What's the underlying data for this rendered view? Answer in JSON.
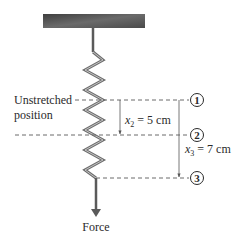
{
  "diagram": {
    "labels": {
      "unstretched_line1": "Unstretched",
      "unstretched_line2": "position",
      "force": "Force"
    },
    "positions": [
      {
        "id": "1",
        "marker": "1"
      },
      {
        "id": "2",
        "marker": "2"
      },
      {
        "id": "3",
        "marker": "3"
      }
    ],
    "displacements": {
      "x2": {
        "var": "x",
        "sub": "2",
        "eq": " = 5 cm",
        "value_cm": 5
      },
      "x3": {
        "var": "x",
        "sub": "3",
        "eq": " = 7 cm",
        "value_cm": 7
      }
    },
    "colors": {
      "ceiling_dark": "#4a4a4a",
      "ceiling_light": "#8a8a8a",
      "spring": "#6e6e6e",
      "spring_highlight": "#bdbdbd",
      "dash": "#6a6a6a",
      "text": "#2a2a2a"
    }
  }
}
